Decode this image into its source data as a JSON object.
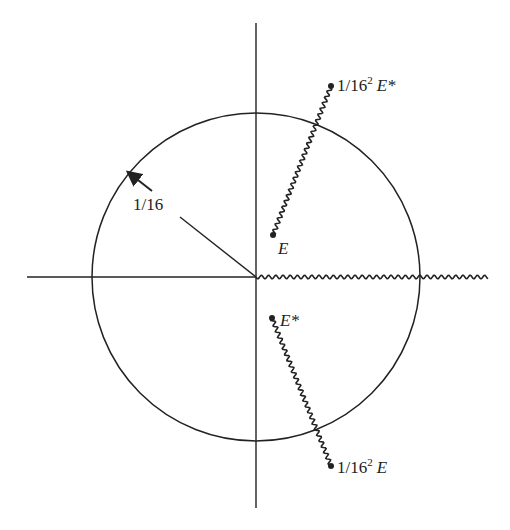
{
  "diagram": {
    "colors": {
      "ink": "#222222",
      "background": "#ffffff"
    },
    "axes": {
      "origin": [
        256,
        277
      ],
      "vertical": {
        "x": 256,
        "y1": 23,
        "y2": 508
      },
      "horizontal": {
        "y": 277,
        "x1": 27,
        "x2": 256
      }
    },
    "circle": {
      "cx": 256,
      "cy": 277,
      "r": 164
    },
    "radius_marker": {
      "label": "1/16",
      "line": {
        "x1": 180,
        "y1": 217,
        "x2": 256,
        "y2": 277
      },
      "arrow": {
        "x1": 152,
        "y1": 191,
        "x2": 129,
        "y2": 173
      },
      "label_pos": [
        133,
        210
      ]
    },
    "branch_cut_real": {
      "x1": 256,
      "y1": 277,
      "x2": 488,
      "y2": 277
    },
    "points": [
      {
        "id": "E",
        "x": 273,
        "y": 235,
        "label": "E",
        "star": "",
        "prefix": "",
        "label_pos": [
          278,
          254
        ]
      },
      {
        "id": "E-star",
        "x": 272,
        "y": 318,
        "label": "E",
        "star": "*",
        "prefix": "",
        "label_pos": [
          280,
          326
        ]
      },
      {
        "id": "inv-E-star",
        "x": 331,
        "y": 86,
        "label": "E",
        "star": "*",
        "prefix": "1/16",
        "exp": "2",
        "label_pos": [
          337,
          91
        ]
      },
      {
        "id": "inv-E",
        "x": 331,
        "y": 466,
        "label": "E",
        "star": "",
        "prefix": "1/16",
        "exp": "2",
        "label_pos": [
          337,
          473
        ]
      }
    ],
    "wavy_cuts": [
      {
        "from": "E",
        "to": "inv-E-star"
      },
      {
        "from": "E-star",
        "to": "inv-E"
      }
    ],
    "labels": {
      "radius": "1/16",
      "E": "E",
      "E_star": "E*",
      "inv_E_star_prefix": "1/16",
      "inv_E_star_exp": "2",
      "inv_E_star_sym": "E*",
      "inv_E_prefix": "1/16",
      "inv_E_exp": "2",
      "inv_E_sym": "E"
    }
  }
}
